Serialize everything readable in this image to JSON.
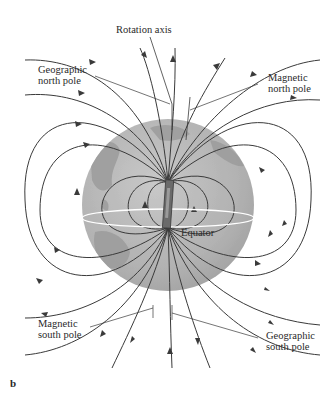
{
  "figure": {
    "panel_letter": "b",
    "labels": {
      "rotation_axis": "Rotation axis",
      "geographic_north_pole": [
        "Geographic",
        "north pole"
      ],
      "magnetic_north_pole": [
        "Magnetic",
        "north pole"
      ],
      "equator": "Equator",
      "magnetic_south_pole": [
        "Magnetic",
        "south pole"
      ],
      "geographic_south_pole": [
        "Geographic",
        "south pole"
      ]
    },
    "colors": {
      "globe_ocean": "#b5b5b5",
      "globe_land": "#9a9a9a",
      "field_lines": "#3a3a3a",
      "equator_line": "#ffffff",
      "magnet": "#6a6a6a",
      "text": "#2a2a2a"
    }
  }
}
